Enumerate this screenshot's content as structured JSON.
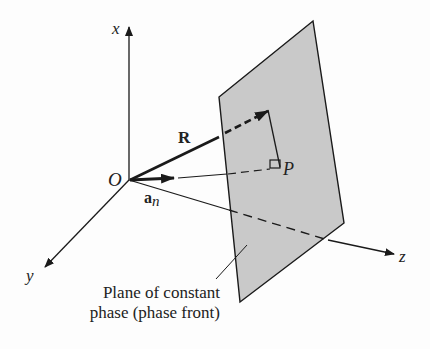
{
  "figure": {
    "axes": {
      "x_label": "x",
      "y_label": "y",
      "z_label": "z",
      "origin_label": "O"
    },
    "vectors": {
      "position_vector_label": "R",
      "normal_vector_label": "a",
      "normal_vector_subscript": "n",
      "point_label": "P"
    },
    "caption": {
      "line1": "Plane of constant",
      "line2": "phase (phase front)"
    },
    "colors": {
      "plane_fill": "#c9c9c9",
      "line": "#1a1a1a",
      "background": "#fdfdfd"
    }
  }
}
